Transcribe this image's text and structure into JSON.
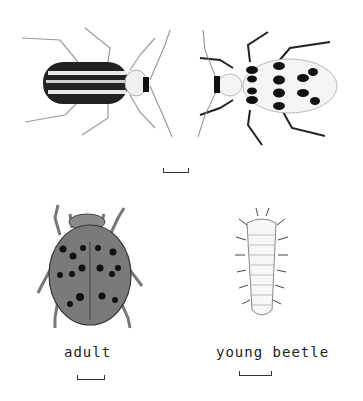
{
  "labels": {
    "adult": "adult",
    "young_beetle": "young beetle"
  },
  "colors": {
    "background": "#ffffff",
    "ink": "#1a1a1a",
    "adult_shell": "#7a7a7a",
    "pale_shell": "#f2f2f2"
  }
}
